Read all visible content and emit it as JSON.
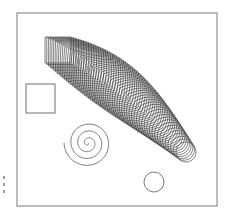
{
  "figure": {
    "frame": {
      "x": 17,
      "y": 13,
      "width": 200,
      "height": 193,
      "stroke": "#7a7a7a"
    },
    "source_square": {
      "x": 26,
      "y": 84,
      "size": 29,
      "stroke": "#6e6e6e"
    },
    "spiral": {
      "cx": 88,
      "cy": 143,
      "turns": 3.5,
      "max_radius": 24,
      "start_angle_deg": 0,
      "stroke": "#7a7a7a"
    },
    "target_circle": {
      "cx": 154,
      "cy": 182,
      "r": 10,
      "stroke": "#7a7a7a"
    },
    "morph": {
      "steps": 60,
      "stroke": "#2a2a2a",
      "start": {
        "shape": "square",
        "cx": 58,
        "cy": 50,
        "half": 13
      },
      "end": {
        "shape": "circle",
        "cx": 186,
        "cy": 152,
        "half": 10
      },
      "control": {
        "cx": 122,
        "cy": 82
      },
      "mid_half": 21
    },
    "margin_marks": [
      176,
      183,
      190
    ]
  }
}
